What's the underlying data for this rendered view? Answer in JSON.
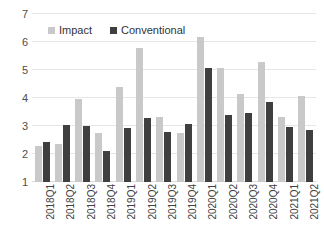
{
  "chart_data": {
    "type": "bar",
    "title": "",
    "subtitle": "",
    "xlabel": "",
    "ylabel": "",
    "categories": [
      "2018Q1",
      "2018Q2",
      "2018Q3",
      "2018Q4",
      "2019Q1",
      "2019Q2",
      "2019Q3",
      "2019Q4",
      "2020Q1",
      "2020Q2",
      "2020Q3",
      "2020Q4",
      "2021Q1",
      "2021Q2"
    ],
    "series": [
      {
        "name": "Impact",
        "color": "#c9c9c9",
        "values": [
          2.3,
          2.36,
          3.96,
          2.76,
          4.4,
          5.8,
          3.33,
          2.75,
          6.18,
          5.06,
          4.16,
          5.3,
          3.33,
          4.08
        ]
      },
      {
        "name": "Conventional",
        "color": "#3f3f3f",
        "values": [
          2.43,
          3.04,
          3.0,
          2.12,
          2.94,
          3.27,
          2.78,
          3.08,
          5.06,
          3.4,
          3.48,
          3.86,
          2.95,
          2.86
        ]
      }
    ],
    "ylim": [
      1,
      7
    ],
    "yticks": [
      1,
      2,
      3,
      4,
      5,
      6,
      7
    ],
    "ytick_labels": [
      "1",
      "2",
      "3",
      "4",
      "5",
      "6",
      "7"
    ],
    "grid": true,
    "grid_axis": "y",
    "legend_position": "top-left-inside",
    "legend_entries": [
      "Impact",
      "Conventional"
    ]
  }
}
